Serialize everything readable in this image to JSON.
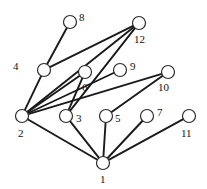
{
  "figure": {
    "type": "graph-diagram",
    "width": 207,
    "height": 189,
    "background_color": "#ffffff",
    "node_fill_color": "#ffffff",
    "node_stroke_color": "#2b2b2b",
    "edge_color": "#1a1a1a",
    "node_radius": 6.5
  },
  "nodes": [
    {
      "id": "1",
      "label": "1",
      "cx": 103,
      "cy": 163,
      "label_x": 100,
      "label_y": 174
    },
    {
      "id": "2",
      "label": "2",
      "cx": 22,
      "cy": 116,
      "label_x": 18,
      "label_y": 128
    },
    {
      "id": "3",
      "label": "3",
      "cx": 66,
      "cy": 116,
      "label_x": 76,
      "label_y": 113
    },
    {
      "id": "4",
      "label": "4",
      "cx": 44,
      "cy": 70,
      "label_x": 13,
      "label_y": 61
    },
    {
      "id": "5",
      "label": "5",
      "cx": 106,
      "cy": 116,
      "label_x": 115,
      "label_y": 113
    },
    {
      "id": "6",
      "label": "6",
      "cx": 85,
      "cy": 72,
      "label_x": 82,
      "label_y": 82
    },
    {
      "id": "7",
      "label": "7",
      "cx": 147,
      "cy": 116,
      "label_x": 157,
      "label_y": 107
    },
    {
      "id": "8",
      "label": "8",
      "cx": 70,
      "cy": 22,
      "label_x": 79,
      "label_y": 12
    },
    {
      "id": "9",
      "label": "9",
      "cx": 120,
      "cy": 70,
      "label_x": 130,
      "label_y": 61
    },
    {
      "id": "10",
      "label": "10",
      "cx": 168,
      "cy": 72,
      "label_x": 158,
      "label_y": 82
    },
    {
      "id": "11",
      "label": "11",
      "cx": 189,
      "cy": 116,
      "label_x": 181,
      "label_y": 128
    },
    {
      "id": "12",
      "label": "12",
      "cx": 139,
      "cy": 23,
      "label_x": 134,
      "label_y": 34
    }
  ],
  "edges": [
    {
      "from": "1",
      "to": "2"
    },
    {
      "from": "1",
      "to": "3"
    },
    {
      "from": "1",
      "to": "5"
    },
    {
      "from": "1",
      "to": "7"
    },
    {
      "from": "1",
      "to": "11"
    },
    {
      "from": "2",
      "to": "4"
    },
    {
      "from": "2",
      "to": "6"
    },
    {
      "from": "2",
      "to": "9"
    },
    {
      "from": "2",
      "to": "10"
    },
    {
      "from": "2",
      "to": "12"
    },
    {
      "from": "3",
      "to": "6"
    },
    {
      "from": "3",
      "to": "12"
    },
    {
      "from": "4",
      "to": "8"
    },
    {
      "from": "4",
      "to": "12"
    },
    {
      "from": "5",
      "to": "10"
    }
  ]
}
